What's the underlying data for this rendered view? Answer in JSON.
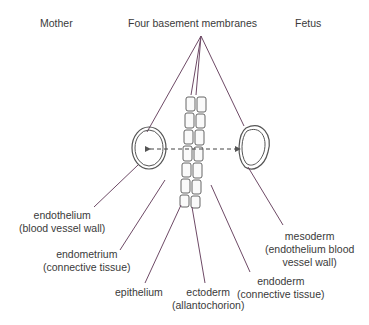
{
  "header": {
    "mother": "Mother",
    "membranes": "Four basement membranes",
    "fetus": "Fetus"
  },
  "labels": {
    "endothelium": {
      "line1": "endothelium",
      "line2": "(blood vessel wall)"
    },
    "endometrium": {
      "line1": "endometrium",
      "line2": "(connective tissue)"
    },
    "epithelium": {
      "line1": "epithelium"
    },
    "ectoderm": {
      "line1": "ectoderm",
      "line2": "(allantochorion)"
    },
    "endoderm": {
      "line1": "endoderm",
      "line2": "(connective tissue)"
    },
    "mesoderm": {
      "line1": "mesoderm",
      "line2": "(endothelium blood",
      "line3": "vessel wall)"
    }
  },
  "colors": {
    "pointer_line": "#6e4a66",
    "outline": "#444444",
    "text": "#3a3a3a"
  }
}
